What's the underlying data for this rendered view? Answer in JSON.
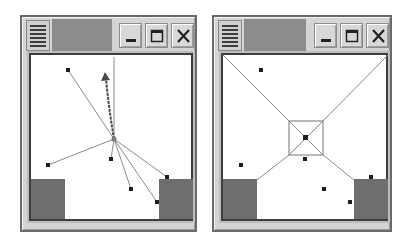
{
  "windows": [
    {
      "id": "left",
      "title": "",
      "buttons": {
        "minimize": "minimize",
        "maximize": "maximize",
        "close": "close"
      },
      "view": "radial-links",
      "hub": {
        "x": 83,
        "y": 82
      },
      "colors": {
        "title_area": "#8c8c8c",
        "frame": "#d4d4d4",
        "block": "#6e6e6e",
        "line": "#8a8a8a",
        "arrow": "#4a4a4a",
        "point": "#1e1e1e"
      },
      "points": [
        {
          "x": 37,
          "y": 14
        },
        {
          "x": 17,
          "y": 110
        },
        {
          "x": 80,
          "y": 103
        },
        {
          "x": 100,
          "y": 133
        },
        {
          "x": 136,
          "y": 122
        },
        {
          "x": 126,
          "y": 146
        }
      ],
      "arrow": {
        "x": 73,
        "y": 19
      },
      "blocks": [
        {
          "x": 0,
          "y": 123,
          "w": 34,
          "h": 40
        },
        {
          "x": 128,
          "y": 123,
          "w": 34,
          "h": 40
        }
      ]
    },
    {
      "id": "right",
      "title": "",
      "buttons": {
        "minimize": "minimize",
        "maximize": "maximize",
        "close": "close"
      },
      "view": "focus-square",
      "center": {
        "x": 82,
        "y": 82
      },
      "square": {
        "x": 66,
        "y": 65,
        "w": 34,
        "h": 34
      },
      "colors": {
        "title_area": "#8c8c8c",
        "frame": "#d4d4d4",
        "block": "#6e6e6e",
        "line": "#8a8a8a",
        "point": "#1e1e1e"
      },
      "points": [
        {
          "x": 38,
          "y": 15
        },
        {
          "x": 18,
          "y": 110
        },
        {
          "x": 82,
          "y": 104
        },
        {
          "x": 101,
          "y": 134
        },
        {
          "x": 127,
          "y": 147
        },
        {
          "x": 148,
          "y": 122
        }
      ],
      "blocks": [
        {
          "x": 0,
          "y": 123,
          "w": 34,
          "h": 40
        },
        {
          "x": 131,
          "y": 123,
          "w": 34,
          "h": 40
        }
      ]
    }
  ]
}
